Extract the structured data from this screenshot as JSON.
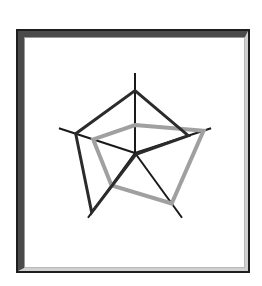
{
  "chart_data": {
    "type": "radar",
    "title": "",
    "axes": [
      "Axis 1",
      "Axis 2",
      "Axis 3",
      "Axis 4",
      "Axis 5"
    ],
    "axis_labels_visible": false,
    "range": [
      0,
      1
    ],
    "grid": false,
    "legend": "none",
    "series": [
      {
        "name": "Series A",
        "color": "#2b2b2b",
        "values": [
          0.78,
          0.7,
          0.02,
          0.92,
          0.78
        ]
      },
      {
        "name": "Series B",
        "color": "#a0a0a0",
        "values": [
          0.35,
          0.9,
          0.78,
          0.5,
          0.55
        ]
      }
    ]
  },
  "layout": {
    "center": [
      135,
      153
    ],
    "radius": 80,
    "axis_color": "#1a1a1a"
  }
}
